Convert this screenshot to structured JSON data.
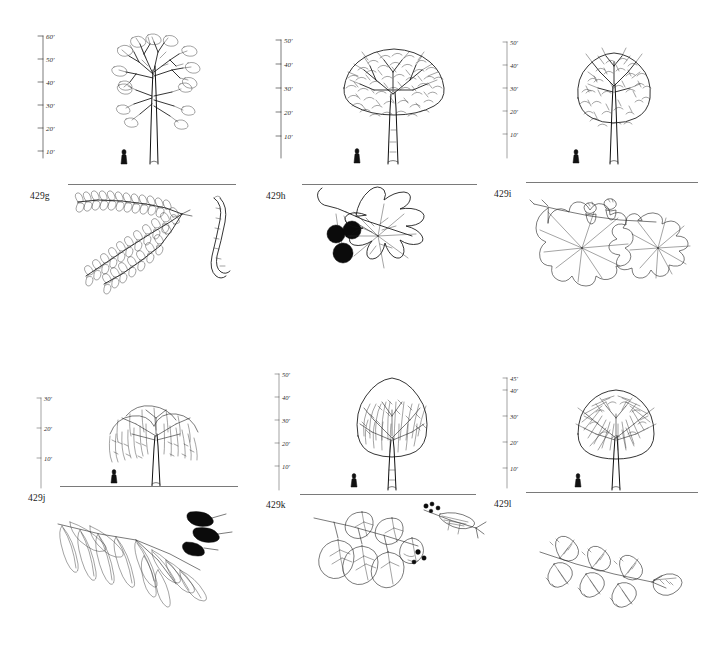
{
  "page": {
    "kind": "botanical-plate",
    "rows": 2,
    "columns": 3
  },
  "panels": [
    {
      "id": "429g",
      "caption": "429g",
      "scale": {
        "unit": "ft",
        "max_label": "60'",
        "ticks": [
          "60'",
          "50'",
          "40'",
          "30'",
          "20'",
          "10'"
        ],
        "tick_values": [
          60,
          50,
          40,
          30,
          20,
          10
        ]
      },
      "tree": {
        "name": "honey-locust-silhouette",
        "form": "open-vase-airy",
        "approx_height_ft": 55
      },
      "detail": {
        "name": "pinnately-compound-leaf-with-pod",
        "elements": [
          "compound-leaf",
          "seed-pod"
        ]
      },
      "figure": "human-scale-figure"
    },
    {
      "id": "429h",
      "caption": "429h",
      "scale": {
        "unit": "ft",
        "max_label": "50'",
        "ticks": [
          "50'",
          "40'",
          "30'",
          "20'",
          "10'"
        ],
        "tick_values": [
          50,
          40,
          30,
          20,
          10
        ]
      },
      "tree": {
        "name": "sycamore-silhouette",
        "form": "broad-rounded-dense",
        "approx_height_ft": 48
      },
      "detail": {
        "name": "lobed-leaf-with-fruit-balls",
        "elements": [
          "lobed-leaf",
          "fruit-ball",
          "fruit-ball",
          "fruit-ball"
        ]
      },
      "figure": "human-scale-figure"
    },
    {
      "id": "429i",
      "caption": "429i",
      "scale": {
        "unit": "ft",
        "max_label": "50'",
        "ticks": [
          "50'",
          "40'",
          "30'",
          "20'",
          "10'"
        ],
        "tick_values": [
          50,
          40,
          30,
          20,
          10
        ]
      },
      "tree": {
        "name": "oak-silhouette",
        "form": "upright-oval-dense",
        "approx_height_ft": 45
      },
      "detail": {
        "name": "oak-leaf-with-acorns",
        "elements": [
          "lobed-oak-leaf",
          "acorn",
          "acorn"
        ]
      },
      "figure": "human-scale-figure"
    },
    {
      "id": "429j",
      "caption": "429j",
      "scale": {
        "unit": "ft",
        "max_label": "30'",
        "ticks": [
          "30'",
          "20'",
          "10'"
        ],
        "tick_values": [
          30,
          20,
          10
        ]
      },
      "tree": {
        "name": "weeping-willow-silhouette",
        "form": "weeping-spreading",
        "approx_height_ft": 28
      },
      "detail": {
        "name": "willow-leaf-spray-with-catkins",
        "elements": [
          "narrow-lanceolate-leaves",
          "catkin",
          "catkin"
        ]
      },
      "figure": "human-scale-figure"
    },
    {
      "id": "429k",
      "caption": "429k",
      "scale": {
        "unit": "ft",
        "max_label": "50'",
        "ticks": [
          "50'",
          "40'",
          "30'",
          "20'",
          "10'"
        ],
        "tick_values": [
          50,
          40,
          30,
          20,
          10
        ]
      },
      "tree": {
        "name": "elm-silhouette",
        "form": "columnar-fan",
        "approx_height_ft": 46
      },
      "detail": {
        "name": "heart-shaped-leaf-branch-with-samaras",
        "elements": [
          "ovate-leaves",
          "flower-cluster",
          "samara-spray"
        ]
      },
      "figure": "human-scale-figure"
    },
    {
      "id": "429l",
      "caption": "429l",
      "scale": {
        "unit": "ft",
        "max_label": "45'",
        "ticks": [
          "45'",
          "40'",
          "30'",
          "20'",
          "10'"
        ],
        "tick_values": [
          45,
          40,
          30,
          20,
          10
        ]
      },
      "tree": {
        "name": "ash-silhouette",
        "form": "rounded-twiggy",
        "approx_height_ft": 42
      },
      "detail": {
        "name": "pinnate-leaflet-spray",
        "elements": [
          "serrate-leaflets"
        ]
      },
      "figure": "human-scale-figure"
    }
  ]
}
